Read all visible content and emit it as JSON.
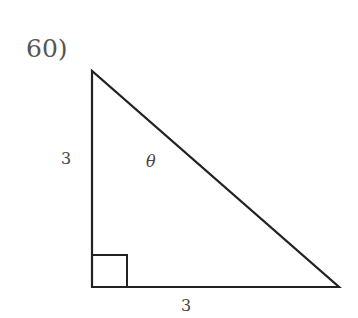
{
  "problem": {
    "number": "60)"
  },
  "triangle": {
    "vertices": {
      "top": [
        92,
        71
      ],
      "right_angle": [
        92,
        287
      ],
      "bottom_right": [
        339,
        287
      ]
    },
    "right_angle_marker": true,
    "stroke_color": "#222222",
    "labels": {
      "left_side": "3",
      "bottom_side": "3",
      "angle": "θ"
    }
  }
}
